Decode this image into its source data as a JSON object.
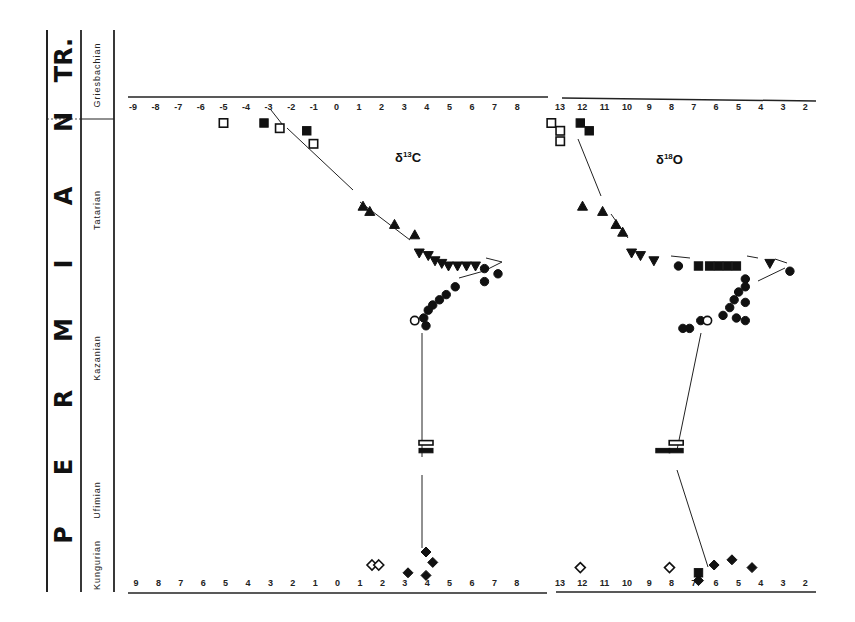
{
  "stratigraphy": {
    "system_label": "P E R M I A N",
    "system_letters": [
      "P",
      "E",
      "R",
      "M",
      "I",
      "A",
      "N"
    ],
    "overlying_system": "TR.",
    "stages": [
      "Griesbachian",
      "Tatarian",
      "Kazanian",
      "Ufimian",
      "Kungurian"
    ]
  },
  "panels": {
    "carbon": {
      "title": "δ13C",
      "title_main": "δ",
      "title_sup": "13",
      "title_elem": "C"
    },
    "oxygen": {
      "title": "δ18O",
      "title_main": "δ",
      "title_sup": "18",
      "title_elem": "O"
    }
  },
  "chart_data": [
    {
      "type": "scatter",
      "title": "δ13C",
      "xlabel": "δ13C (‰)",
      "ylabel": "Stratigraphic position (Kungurian → Griesbachian)",
      "x_ticks_top": [
        "-9",
        "-8",
        "-7",
        "-6",
        "-5",
        "-4",
        "-3",
        "-2",
        "-1",
        "0",
        "1",
        "2",
        "3",
        "4",
        "5",
        "6",
        "7",
        "8"
      ],
      "x_ticks_bottom": [
        "9",
        "8",
        "7",
        "6",
        "5",
        "4",
        "3",
        "2",
        "1",
        "0",
        "1",
        "2",
        "3",
        "4",
        "5",
        "6",
        "7",
        "8"
      ],
      "xlim": [
        -9,
        8
      ],
      "grid": false,
      "series": [
        {
          "name": "Griesbachian open squares",
          "marker": "square-open",
          "points": [
            [
              -5,
              1
            ],
            [
              -2.5,
              1.2
            ],
            [
              -1,
              1.8
            ]
          ]
        },
        {
          "name": "Griesbachian filled squares",
          "marker": "square-filled",
          "points": [
            [
              -3.2,
              1
            ],
            [
              -1.3,
              1.3
            ]
          ]
        },
        {
          "name": "Tatarian triangles up",
          "marker": "triangle-up",
          "points": [
            [
              1.2,
              4.2
            ],
            [
              1.5,
              4.4
            ],
            [
              2.6,
              4.9
            ],
            [
              3.5,
              5.3
            ]
          ]
        },
        {
          "name": "Tatarian triangles down",
          "marker": "triangle-down",
          "points": [
            [
              3.7,
              6.0
            ],
            [
              4.1,
              6.1
            ],
            [
              4.4,
              6.3
            ],
            [
              4.7,
              6.4
            ],
            [
              5.0,
              6.5
            ],
            [
              5.4,
              6.5
            ],
            [
              5.8,
              6.5
            ],
            [
              6.2,
              6.5
            ]
          ]
        },
        {
          "name": "Kazanian circles",
          "marker": "circle-filled",
          "points": [
            [
              6.6,
              6.6
            ],
            [
              7.2,
              6.8
            ],
            [
              6.6,
              7.1
            ],
            [
              5.3,
              7.3
            ],
            [
              4.9,
              7.6
            ],
            [
              4.6,
              7.8
            ],
            [
              4.3,
              8.0
            ],
            [
              4.1,
              8.2
            ],
            [
              3.9,
              8.5
            ],
            [
              4.0,
              8.8
            ]
          ]
        },
        {
          "name": "Kazanian open circle",
          "marker": "circle-open",
          "points": [
            [
              3.5,
              8.6
            ]
          ]
        },
        {
          "name": "Ufimian open rect",
          "marker": "rect-open",
          "points": [
            [
              4.0,
              13.3
            ]
          ]
        },
        {
          "name": "Ufimian filled rect",
          "marker": "rect-filled",
          "points": [
            [
              4.0,
              13.6
            ]
          ]
        },
        {
          "name": "Kungurian filled diamonds",
          "marker": "diamond-filled",
          "points": [
            [
              4.0,
              17.5
            ],
            [
              4.3,
              17.9
            ],
            [
              3.2,
              18.3
            ],
            [
              4.0,
              18.4
            ]
          ]
        },
        {
          "name": "Kungurian open diamonds",
          "marker": "diamond-open",
          "points": [
            [
              1.6,
              18.0
            ],
            [
              1.9,
              18.0
            ]
          ]
        }
      ]
    },
    {
      "type": "scatter",
      "title": "δ18O",
      "xlabel": "δ18O (‰, reversed)",
      "ylabel": "Stratigraphic position",
      "x_ticks_top": [
        "13",
        "12",
        "11",
        "10",
        "9",
        "8",
        "7",
        "6",
        "5",
        "4",
        "3",
        "2"
      ],
      "x_ticks_bottom": [
        "13",
        "12",
        "11",
        "10",
        "9",
        "8",
        "7",
        "6",
        "5",
        "4",
        "3",
        "2"
      ],
      "xlim": [
        13,
        2
      ],
      "grid": false,
      "series": [
        {
          "name": "Griesbachian open squares",
          "marker": "square-open",
          "points": [
            [
              13.3,
              1
            ],
            [
              12.9,
              1.3
            ],
            [
              12.9,
              1.7
            ]
          ]
        },
        {
          "name": "Griesbachian filled squares",
          "marker": "square-filled",
          "points": [
            [
              12.0,
              1
            ],
            [
              11.6,
              1.3
            ]
          ]
        },
        {
          "name": "Tatarian triangles up",
          "marker": "triangle-up",
          "points": [
            [
              11.9,
              4.2
            ],
            [
              11.0,
              4.4
            ],
            [
              10.4,
              4.9
            ],
            [
              10.1,
              5.2
            ]
          ]
        },
        {
          "name": "Tatarian triangles down",
          "marker": "triangle-down",
          "points": [
            [
              9.7,
              6.0
            ],
            [
              9.3,
              6.1
            ],
            [
              8.7,
              6.3
            ],
            [
              3.5,
              6.4
            ]
          ]
        },
        {
          "name": "Tatarian filled squares/triangles",
          "marker": "mixed-filled",
          "points": [
            [
              6.7,
              6.5
            ],
            [
              6.2,
              6.5
            ],
            [
              5.8,
              6.5
            ],
            [
              5.4,
              6.5
            ],
            [
              5.0,
              6.5
            ]
          ]
        },
        {
          "name": "Kazanian circles",
          "marker": "circle-filled",
          "points": [
            [
              7.6,
              6.5
            ],
            [
              2.6,
              6.7
            ],
            [
              4.6,
              7.0
            ],
            [
              4.6,
              7.3
            ],
            [
              4.9,
              7.5
            ],
            [
              5.1,
              7.8
            ],
            [
              4.6,
              7.9
            ],
            [
              5.3,
              8.1
            ],
            [
              5.6,
              8.4
            ],
            [
              5.0,
              8.5
            ],
            [
              4.6,
              8.6
            ],
            [
              6.6,
              8.6
            ],
            [
              7.1,
              8.9
            ],
            [
              7.4,
              8.9
            ]
          ]
        },
        {
          "name": "Kazanian open circle",
          "marker": "circle-open",
          "points": [
            [
              6.3,
              8.6
            ]
          ]
        },
        {
          "name": "Ufimian open rect",
          "marker": "rect-open",
          "points": [
            [
              7.7,
              13.3
            ]
          ]
        },
        {
          "name": "Ufimian filled rects",
          "marker": "rect-filled",
          "points": [
            [
              8.3,
              13.6
            ],
            [
              7.7,
              13.6
            ]
          ]
        },
        {
          "name": "Kungurian filled diamonds",
          "marker": "diamond-filled",
          "points": [
            [
              6.0,
              18.0
            ],
            [
              5.2,
              17.8
            ],
            [
              4.3,
              18.1
            ],
            [
              6.7,
              18.6
            ]
          ]
        },
        {
          "name": "Kungurian filled square",
          "marker": "square-filled",
          "points": [
            [
              6.7,
              18.3
            ]
          ]
        },
        {
          "name": "Kungurian open diamonds",
          "marker": "diamond-open",
          "points": [
            [
              12.0,
              18.1
            ],
            [
              8.0,
              18.1
            ]
          ]
        }
      ]
    }
  ]
}
